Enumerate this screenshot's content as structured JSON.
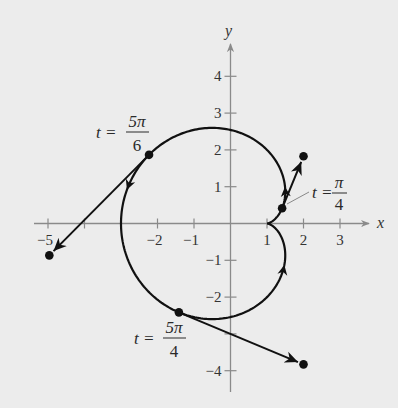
{
  "chart_data": {
    "type": "line",
    "title": "",
    "xlabel": "x",
    "ylabel": "y",
    "xlim": [
      -5.4,
      3.8
    ],
    "ylim": [
      -4.5,
      4.8
    ],
    "grid": false,
    "x_ticks": [
      -5,
      -4,
      -3,
      -2,
      -1,
      1,
      2,
      3
    ],
    "x_tick_labels": [
      {
        "value": -5,
        "label": "−5"
      },
      {
        "value": -2,
        "label": "−2"
      },
      {
        "value": -1,
        "label": "−1"
      },
      {
        "value": 1,
        "label": "1"
      },
      {
        "value": 2,
        "label": "2"
      },
      {
        "value": 3,
        "label": "3"
      }
    ],
    "y_ticks": [
      -4,
      -3,
      -2,
      -1,
      1,
      2,
      3,
      4
    ],
    "y_tick_labels": [
      {
        "value": 4,
        "label": "4"
      },
      {
        "value": 3,
        "label": "3"
      },
      {
        "value": 2,
        "label": "2"
      },
      {
        "value": 1,
        "label": "1"
      },
      {
        "value": -1,
        "label": "−1"
      },
      {
        "value": -2,
        "label": "−2"
      },
      {
        "value": -4,
        "label": "−4"
      }
    ],
    "curve": {
      "x_expr": "2cos(t) - cos(2t)",
      "y_expr": "2sin(t) - sin(2t)",
      "t_range": [
        0,
        6.2832
      ],
      "direction": "counterclockwise",
      "cusp": [
        1,
        0
      ],
      "direction_arrows_t": [
        1.1,
        2.9,
        5.1
      ]
    },
    "velocity_vectors": [
      {
        "t_label": "π",
        "t_den": "4",
        "point": [
          1.414,
          0.414
        ],
        "tip": [
          2.0,
          1.828
        ]
      },
      {
        "t_label": "5π",
        "t_den": "6",
        "point": [
          -2.232,
          1.866
        ],
        "tip": [
          -4.964,
          -0.866
        ]
      },
      {
        "t_label": "5π",
        "t_den": "4",
        "point": [
          -1.414,
          -2.414
        ],
        "tip": [
          2.0,
          -3.828
        ]
      }
    ],
    "annotations": [
      {
        "text": "t = π/4",
        "anchor": [
          1.414,
          0.414
        ]
      },
      {
        "text": "t = 5π/6",
        "anchor": [
          -2.232,
          1.866
        ]
      },
      {
        "text": "t = 5π/4",
        "anchor": [
          -1.414,
          -2.414
        ]
      }
    ]
  },
  "labels": {
    "x_axis": "x",
    "y_axis": "y",
    "t_eq": "t =",
    "ann_pi4_num": "π",
    "ann_pi4_den": "4",
    "ann_5pi6_num": "5π",
    "ann_5pi6_den": "6",
    "ann_5pi4_num": "5π",
    "ann_5pi4_den": "4"
  },
  "colors": {
    "background": "#ececec",
    "axis": "#8a8a8a",
    "curve": "#111111",
    "text": "#2a2a2a"
  }
}
